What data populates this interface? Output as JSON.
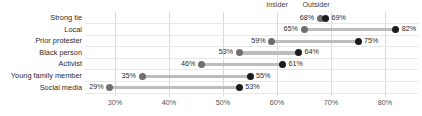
{
  "chart_data": {
    "type": "scatter",
    "subtype": "dumbbell-dot-plot",
    "title": "",
    "subtitle": "",
    "xlabel": "",
    "ylabel": "",
    "xlim": [
      25,
      85
    ],
    "xticks": [
      30,
      40,
      50,
      60,
      70,
      80
    ],
    "xtick_labels": [
      "30%",
      "40%",
      "50%",
      "60%",
      "70%",
      "80%"
    ],
    "grid": true,
    "legend_position": "above-first-row",
    "categories": [
      "Strong tie",
      "Local",
      "Prior protester",
      "Black person",
      "Activist",
      "Young family member",
      "Social media"
    ],
    "series": [
      {
        "name": "Insider",
        "color": "#6e6e6e",
        "values": [
          68,
          65,
          59,
          53,
          46,
          35,
          29
        ],
        "value_labels": [
          "68%",
          "65%",
          "59%",
          "53%",
          "46%",
          "35%",
          "29%"
        ]
      },
      {
        "name": "Outsider",
        "color": "#1c1c1c",
        "values": [
          69,
          82,
          75,
          64,
          61,
          55,
          53
        ],
        "value_labels": [
          "69%",
          "82%",
          "75%",
          "64%",
          "61%",
          "55%",
          "53%"
        ]
      }
    ],
    "connector_color": "#bdbdbd",
    "gridline_color": "#d9d9d9"
  },
  "annotations": {
    "insider_label": "Insider",
    "outsider_label": "Outsider"
  }
}
